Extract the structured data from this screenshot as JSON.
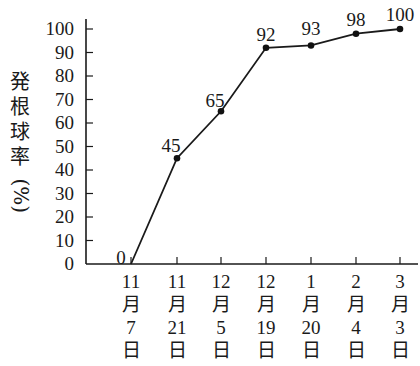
{
  "chart_data": {
    "type": "line",
    "title": "",
    "xlabel": "",
    "ylabel": "発根球率（%）",
    "ylim": [
      0,
      100
    ],
    "yticks": [
      0,
      10,
      20,
      30,
      40,
      50,
      60,
      70,
      80,
      90,
      100
    ],
    "categories": [
      "11月7日",
      "11月21日",
      "12月5日",
      "12月19日",
      "1月20日",
      "2月4日",
      "3月3日"
    ],
    "category_parts": [
      [
        "11",
        "月",
        "7",
        "日"
      ],
      [
        "11",
        "月",
        "21",
        "日"
      ],
      [
        "12",
        "月",
        "5",
        "日"
      ],
      [
        "12",
        "月",
        "19",
        "日"
      ],
      [
        "1",
        "月",
        "20",
        "日"
      ],
      [
        "2",
        "月",
        "4",
        "日"
      ],
      [
        "3",
        "月",
        "3",
        "日"
      ]
    ],
    "values": [
      0,
      45,
      65,
      92,
      93,
      98,
      100
    ],
    "data_labels": [
      "0",
      "45",
      "65",
      "92",
      "93",
      "98",
      "100"
    ],
    "grid": false,
    "legend": null
  },
  "ylabel_chars": [
    "発",
    "根",
    "球",
    "率"
  ],
  "ylabel_unit": "(%)",
  "colors": {
    "line": "#1a1a1a",
    "marker": "#111111",
    "axis": "#1a1a1a"
  }
}
